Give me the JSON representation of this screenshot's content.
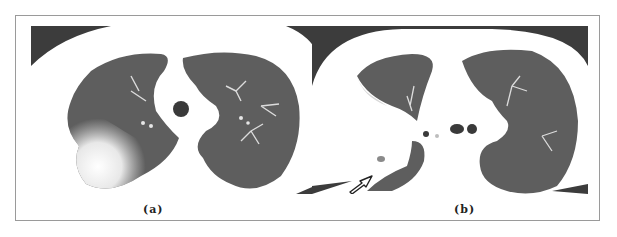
{
  "figure": {
    "panels": [
      {
        "label": "(a)",
        "description": "Axial chest CT, lung window: dense consolidation with ground-glass opacity in the right lung; left lung clear"
      },
      {
        "label": "(b)",
        "description": "Axial chest CT, lung window: right lung largely collapsed/opacified with a small nodule indicated by an arrow; left lung clear"
      }
    ],
    "annotation": {
      "type": "arrow",
      "panel": "(b)",
      "target": "nodule"
    },
    "colors": {
      "lung": "#5e5e5e",
      "soft_tissue": "#ffffff",
      "air_outside": "#3c3c3c",
      "border": "#9a9a9a"
    }
  }
}
